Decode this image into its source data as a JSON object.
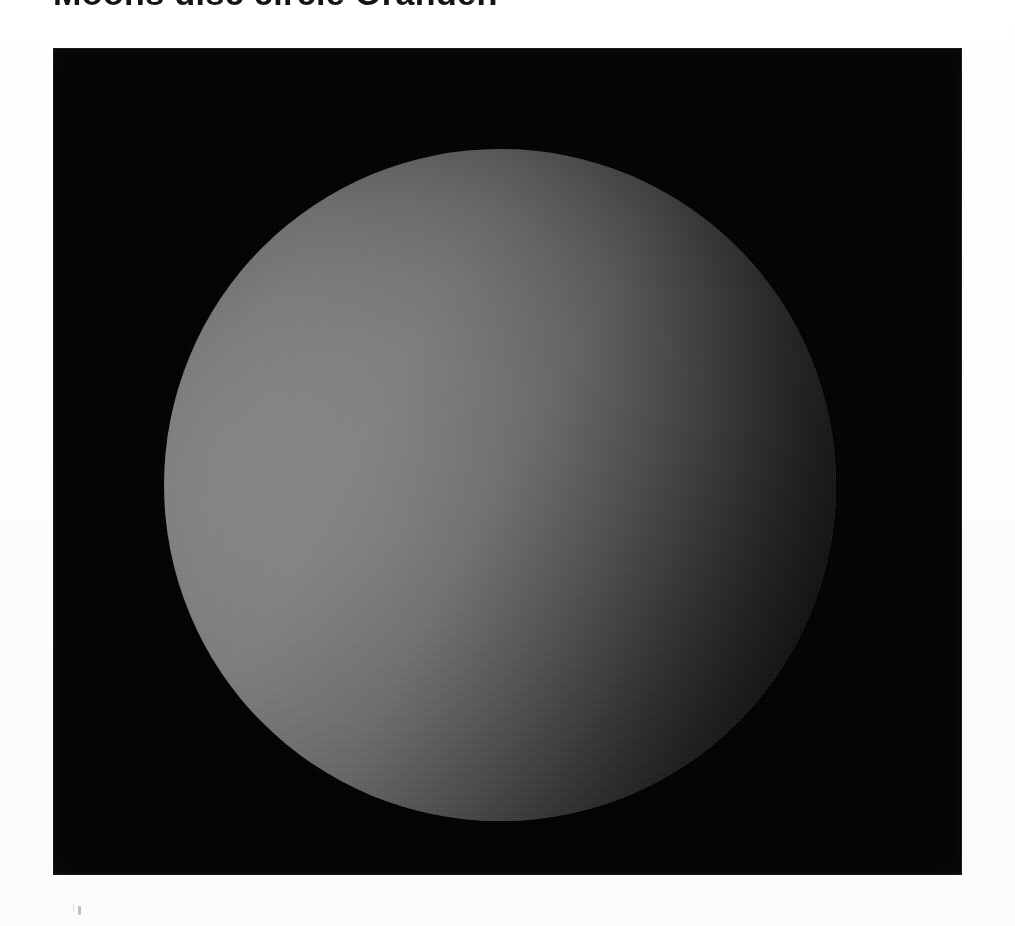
{
  "page": {
    "kind": "scanned-photographic-plate",
    "background_color": "#ffffff",
    "width": 1015,
    "height": 926
  },
  "title": {
    "text": "Moons disc circle Orander.",
    "color": "#141414",
    "clipped_at_top": true
  },
  "plate": {
    "name": "astronomical-plate",
    "frame_color": "#000000",
    "left": 53,
    "top": 48,
    "width": 909,
    "height": 827
  },
  "disc": {
    "label": "lunar-disc",
    "center_x": 500,
    "center_y": 485,
    "radius": 336,
    "highlight_color": "#919191",
    "midtone_color": "#8a8a8a",
    "limb_color": "#343434",
    "field_color": "#000000",
    "illumination_direction": "lower-left",
    "shadow_direction": "upper-right"
  },
  "artifacts": {
    "speck_label": "scan-dust-speck",
    "speck_color": "#787878"
  }
}
